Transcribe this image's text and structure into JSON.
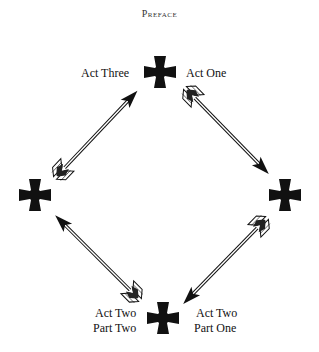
{
  "header": {
    "title": "Preface"
  },
  "diagram": {
    "nodes": [
      {
        "id": "top",
        "label": "",
        "x": 160,
        "y": 72
      },
      {
        "id": "right",
        "label": "",
        "x": 285,
        "y": 195
      },
      {
        "id": "bottom",
        "label": "",
        "x": 163,
        "y": 318
      },
      {
        "id": "left",
        "label": "",
        "x": 35,
        "y": 195
      }
    ],
    "labels": {
      "act_one": "Act One",
      "act_three": "Act Three",
      "act_two_part_one_line1": "Act Two",
      "act_two_part_one_line2": "Part One",
      "act_two_part_two_line1": "Act Two",
      "act_two_part_two_line2": "Part Two"
    },
    "arrows": [
      {
        "from": "top",
        "to": "right"
      },
      {
        "from": "right",
        "to": "bottom"
      },
      {
        "from": "bottom",
        "to": "left"
      },
      {
        "from": "left",
        "to": "top"
      }
    ],
    "icons": {
      "node": "cross-pattee-icon",
      "edge": "arrow-icon"
    },
    "colors": {
      "ink": "#111111",
      "background": "#ffffff"
    }
  }
}
